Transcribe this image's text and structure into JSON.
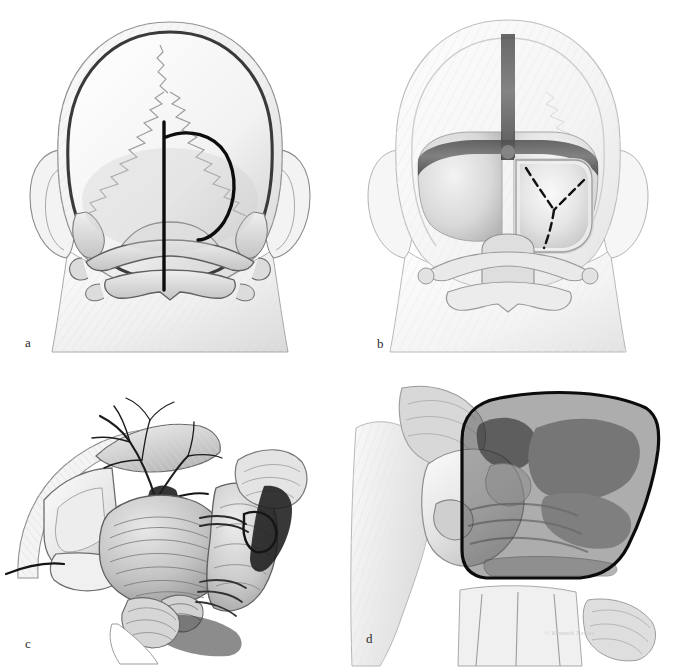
{
  "figure": {
    "domain": "medical-anatomical-illustration",
    "medium": "grayscale pen-and-ink / airbrush medical illustration",
    "background_color": "#ffffff",
    "panel_count": 4,
    "layout": "2x2 grid",
    "width_px": 679,
    "height_px": 667
  },
  "panels": [
    {
      "id": "a",
      "label": "a",
      "caption_letter": "a",
      "view": "posterior (occipital) view of head and skull",
      "description": "Translucent head in posterior view showing the occipital squama, lambdoid sutures, mastoid processes, both ears, and the C1 atlas and C2 axis vertebrae. Two planned skin incision lines are drawn in heavy black: a straight vertical midline incision and a right-sided reversed-D (hockey-stick / horseshoe) paramedian incision.",
      "structures": [
        "scalp outline",
        "skull outline",
        "occipital bone",
        "lambdoid suture",
        "sagittal suture",
        "mastoid process (left)",
        "mastoid process (right)",
        "auricle (left ear)",
        "auricle (right ear)",
        "C1 atlas posterior arch",
        "C2 axis spinous process",
        "neck soft tissue"
      ],
      "markings": [
        {
          "name": "midline-vertical-incision",
          "style": "solid",
          "color": "#111111",
          "weight": "heavy"
        },
        {
          "name": "reversed-d-curvilinear-incision",
          "style": "solid",
          "color": "#111111",
          "weight": "heavy"
        }
      ]
    },
    {
      "id": "b",
      "label": "b",
      "caption_letter": "b",
      "view": "posterior view after suboccipital craniotomy",
      "description": "Same posterior orientation with the occipital bone removed to expose the dura mater. The transverse sinuses run horizontally and the occipital sinus runs vertically in the midline, shown as dark bands. A right suboccipital bone window is open; a dashed Y-shaped dural incision is marked on the exposed dura.",
      "structures": [
        "scalp outline",
        "exposed dura mater",
        "transverse sinus (left)",
        "transverse sinus (right)",
        "superior sagittal / occipital sinus",
        "torcular herophili",
        "craniotomy bone window (right)",
        "bone flap edge",
        "foramen magnum rim",
        "C1 atlas",
        "C2 axis",
        "auricle (left ear)",
        "auricle (right ear)"
      ],
      "markings": [
        {
          "name": "y-shaped-dural-incision",
          "style": "dashed",
          "color": "#111111",
          "weight": "medium"
        }
      ]
    },
    {
      "id": "c",
      "label": "c",
      "caption_letter": "c",
      "view": "operative microscopic view of the cerebellopontine angle / posterior fossa",
      "description": "Detailed intradural surgical exposure after dural opening and cerebellar retraction. Arachnoid vessels branch over the cerebellar hemisphere, the petrosal surface and brainstem are seen, with cranial nerves and arteries crossing the cisternal space. Retracted dural leaflets and a retractor blade occupy the left margin.",
      "structures": [
        "reflected dura mater leaflet",
        "retractor blade",
        "cerebellar hemisphere",
        "petrosal surface of cerebellum",
        "superior petrosal vein complex",
        "branching cortical / arachnoid veins",
        "tentorium cerebelli edge",
        "brainstem (pons / medulla)",
        "cranial nerve bundle (VII / VIII complex)",
        "lower cranial nerves (IX, X, XI)",
        "anterior inferior cerebellar artery",
        "vertebral artery",
        "choroid plexus",
        "flocculus",
        "suture / stay stitch"
      ],
      "markings": []
    },
    {
      "id": "d",
      "label": "d",
      "caption_letter": "d",
      "view": "oblique lateral view of the skull base and craniocervical junction",
      "description": "Lateral-oblique rendering of the occiput, mastoid and upper cervical spine. A rounded quadrilateral region of surgical exposure is outlined in heavy black and filled with a translucent dark grey tint, indicating the extent of the bony removal over the retrosigmoid / far-lateral corridor.",
      "structures": [
        "occipital bone",
        "mastoid process",
        "external auditory region",
        "occipital condyle",
        "foramen magnum rim",
        "C1 atlas lateral mass",
        "C2 axis",
        "cervical vertebrae",
        "suboccipital musculature"
      ],
      "markings": [
        {
          "name": "shaded-exposure-outline",
          "style": "solid-outline-with-tint",
          "color": "#111111",
          "fill": "rgba(60,60,60,0.45)",
          "weight": "heavy"
        }
      ]
    }
  ],
  "signature": {
    "text": "© Kenneth Xavier",
    "visible": true,
    "note": "faint artist credit, barely legible"
  },
  "palette": {
    "background": "#ffffff",
    "ink_dark": "#111111",
    "ink_mid": "#555555",
    "ink_light": "#9a9a9a",
    "tissue_light": "#ededed",
    "tissue_mid": "#c8c8c8",
    "tissue_dark": "#8d8d8d",
    "bone_fill": "#dcdcdc",
    "shade_overlay": "rgba(60,60,60,0.45)",
    "label_color": "#2a2a2a"
  }
}
